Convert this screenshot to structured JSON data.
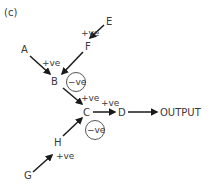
{
  "figure": {
    "label": "(c)",
    "nodes": {
      "A": "A",
      "B": "B",
      "C": "C",
      "D": "D",
      "E": "E",
      "F": "F",
      "G": "G",
      "H": "H",
      "output": "OUTPUT"
    },
    "edges": [
      {
        "from": "E",
        "to": "F",
        "label": "+ve"
      },
      {
        "from": "A",
        "to": "B",
        "label": "+ve"
      },
      {
        "from": "F",
        "to": "B",
        "label": ""
      },
      {
        "from": "B",
        "to": "C",
        "label": "+ve"
      },
      {
        "from": "C",
        "to": "D",
        "label": "+ve"
      },
      {
        "from": "D",
        "to": "OUTPUT",
        "label": ""
      },
      {
        "from": "G",
        "to": "H",
        "label": "+ve"
      },
      {
        "from": "H",
        "to": "C",
        "label": ""
      }
    ],
    "annotations": {
      "b_feedback": "−ve",
      "c_feedback": "−ve"
    }
  }
}
